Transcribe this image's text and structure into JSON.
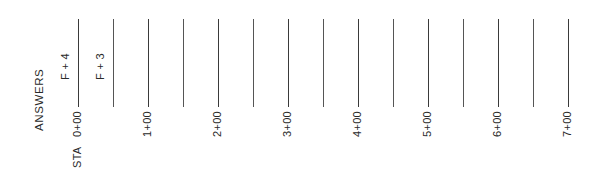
{
  "worksheet": {
    "section_label": "ANSWERS",
    "station_prefix": "STA",
    "answers": [
      {
        "station": "0+00",
        "value": "F + 4"
      },
      {
        "station": "0+50",
        "value": "F + 3"
      }
    ],
    "stations": [
      {
        "label": "0+00",
        "major": true
      },
      {
        "label": "",
        "major": false
      },
      {
        "label": "1+00",
        "major": true
      },
      {
        "label": "",
        "major": false
      },
      {
        "label": "2+00",
        "major": true
      },
      {
        "label": "",
        "major": false
      },
      {
        "label": "3+00",
        "major": true
      },
      {
        "label": "",
        "major": false
      },
      {
        "label": "4+00",
        "major": true
      },
      {
        "label": "",
        "major": false
      },
      {
        "label": "5+00",
        "major": true
      },
      {
        "label": "",
        "major": false
      },
      {
        "label": "6+00",
        "major": true
      },
      {
        "label": "",
        "major": false
      },
      {
        "label": "7+00",
        "major": true
      }
    ]
  }
}
